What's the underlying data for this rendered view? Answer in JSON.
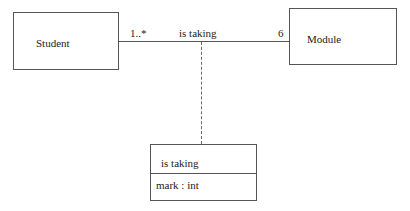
{
  "diagram": {
    "type": "UML class diagram with association class",
    "classes": [
      {
        "name": "Student"
      },
      {
        "name": "Module"
      }
    ],
    "association": {
      "name": "is taking",
      "student_multiplicity": "1..*",
      "module_multiplicity": "6"
    },
    "association_class": {
      "name": "is taking",
      "attributes": [
        "mark : int"
      ]
    }
  }
}
